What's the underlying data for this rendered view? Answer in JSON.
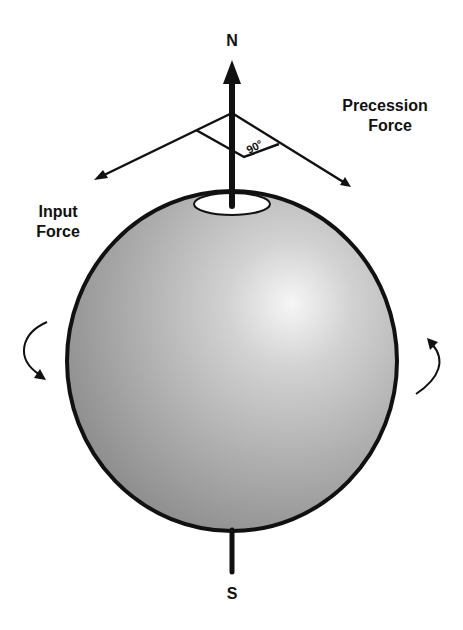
{
  "diagram": {
    "type": "gyroscopic-precession",
    "labels": {
      "north": "N",
      "south": "S",
      "precession_force_line1": "Precession",
      "precession_force_line2": "Force",
      "input_force_line1": "Input",
      "input_force_line2": "Force",
      "angle": "90°"
    },
    "colors": {
      "stroke": "#111111",
      "sphere_light": "#f4f4f4",
      "sphere_mid": "#bdbdbd",
      "sphere_dark": "#8e8e8e",
      "background": "#ffffff"
    },
    "icons": {
      "rotation_left": "curved-arrow-down-icon",
      "rotation_right": "curved-arrow-up-icon"
    }
  }
}
